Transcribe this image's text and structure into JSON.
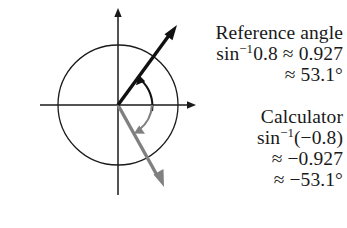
{
  "figure": {
    "width": 347,
    "height": 228,
    "background_color": "#ffffff"
  },
  "diagram": {
    "type": "unit-circle",
    "origin": {
      "x": 118,
      "y": 105
    },
    "radius": 60,
    "axes": {
      "x_axis": {
        "from_x": 40,
        "to_x": 196,
        "y": 105,
        "arrow": "right"
      },
      "y_axis": {
        "x": 118,
        "from_y": 195,
        "to_y": 8,
        "arrow": "up"
      }
    },
    "circle": {
      "color": "#1a1a1a",
      "stroke_width": 1.2
    },
    "vectors": [
      {
        "name": "reference-angle-vector",
        "color": "#111111",
        "angle_degrees": 53.1,
        "tip": {
          "x": 176,
          "y": 27
        },
        "stroke_width": 3.4
      },
      {
        "name": "calculator-angle-vector",
        "color": "#808080",
        "angle_degrees": -53.1,
        "tip": {
          "x": 164,
          "y": 183
        },
        "stroke_width": 3.4
      }
    ],
    "arcs": [
      {
        "name": "reference-angle-arc",
        "color": "#111111",
        "direction": "counterclockwise",
        "from_degrees": 0,
        "to_degrees": 53.1
      },
      {
        "name": "calculator-angle-arc",
        "color": "#808080",
        "direction": "clockwise",
        "from_degrees": 0,
        "to_degrees": -53.1
      }
    ]
  },
  "reference_block": {
    "heading": "Reference angle",
    "line1": {
      "fn": "sin",
      "exponent": "−1",
      "argument": "0.8",
      "relation": "≈",
      "value": "0.927"
    },
    "line2": {
      "relation": "≈",
      "value": "53.1°"
    }
  },
  "calculator_block": {
    "heading": "Calculator",
    "line1": {
      "fn": "sin",
      "exponent": "−1",
      "argument": "(−0.8)"
    },
    "line2": {
      "relation": "≈",
      "value": "−0.927"
    },
    "line3": {
      "relation": "≈",
      "value": "−53.1°"
    }
  }
}
